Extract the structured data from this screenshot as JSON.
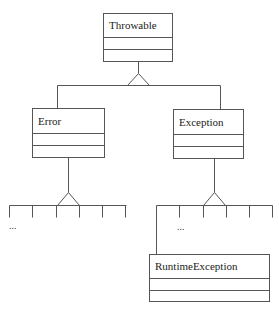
{
  "diagram": {
    "type": "uml-class-hierarchy",
    "classes": {
      "throwable": {
        "name": "Throwable"
      },
      "error": {
        "name": "Error"
      },
      "exception": {
        "name": "Exception"
      },
      "runtime_exception": {
        "name": "RuntimeException"
      }
    },
    "ellipses": {
      "error_subclasses": "...",
      "exception_subclasses": "..."
    },
    "relationships": [
      {
        "child": "Error",
        "parent": "Throwable",
        "kind": "generalization"
      },
      {
        "child": "Exception",
        "parent": "Throwable",
        "kind": "generalization"
      },
      {
        "child": "RuntimeException",
        "parent": "Exception",
        "kind": "generalization"
      }
    ],
    "colors": {
      "line": "#555555",
      "text": "#222222",
      "background": "#ffffff"
    }
  }
}
